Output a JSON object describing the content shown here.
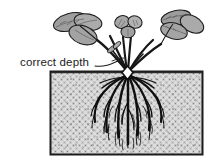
{
  "figure": {
    "background_color": "#ffffff"
  },
  "annotation": {
    "label": "correct depth",
    "leader_line": "line from label to plant crown at soil surface"
  },
  "soil": {
    "name": "soil block",
    "fill_color": "#d9d9d9",
    "stipple_color": "#8a8a8a",
    "border_color": "#1a1a1a",
    "bounds": {
      "x": 50,
      "y": 71,
      "width": 153,
      "height": 84
    }
  },
  "plant": {
    "crown": {
      "name": "crown",
      "fill_color": "#ffffff",
      "outline_color": "#111111",
      "position": {
        "x": 127,
        "y": 72
      }
    },
    "foliage_color": "#9a9a9a",
    "outline_color": "#1a1a1a",
    "root_color": "#111111",
    "leaves": [
      {
        "name": "left trifoliate leaf"
      },
      {
        "name": "center young trifoliate leaf"
      },
      {
        "name": "right trifoliate leaf"
      }
    ],
    "roots": {
      "name": "fibrous root system",
      "count_visible": 9
    }
  }
}
